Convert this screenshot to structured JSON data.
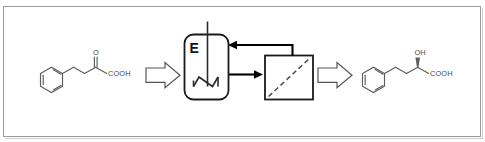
{
  "figure": {
    "border_color": "#9a9a9a",
    "background": "#ffffff"
  },
  "substrate": {
    "name": "2-oxo-4-phenylbutanoic acid",
    "carbonyl_label": "O",
    "acid_label": "COOH",
    "ring": "benzene-ring"
  },
  "product": {
    "name": "(R)-2-hydroxy-4-phenylbutanoic acid",
    "hydroxy_label": "OH",
    "acid_label": "COOH",
    "ring": "benzene-ring",
    "stereo": "wedge-bond"
  },
  "reactor": {
    "label": "E",
    "name": "enzyme-reactor",
    "stirrer": "impeller-shaft"
  },
  "separator": {
    "name": "membrane-separator",
    "element": "diagonal-dashed-membrane"
  },
  "streams": {
    "feed_arrow": "block-arrow-right",
    "reactor_to_separator": "arrow-right",
    "recycle": "arrow-left",
    "product_arrow": "block-arrow-right"
  },
  "colors": {
    "molecule_stroke": "#5d5d5d",
    "flow_stroke": "#000000",
    "unit_stroke": "#1a1a1a",
    "membrane_stroke": "#4a4a4a"
  }
}
